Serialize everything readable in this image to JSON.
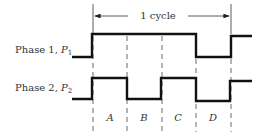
{
  "diagram": {
    "cycle_label": "1 cycle",
    "signals": [
      {
        "name": "Phase 1",
        "symbol": "P",
        "subscript": "1",
        "sequence": [
          "low",
          "high",
          "high",
          "high",
          "low",
          "high"
        ]
      },
      {
        "name": "Phase 2",
        "symbol": "P",
        "subscript": "2",
        "sequence": [
          "low",
          "high",
          "low",
          "high",
          "low",
          "high"
        ]
      }
    ],
    "intervals": [
      "A",
      "B",
      "C",
      "D"
    ],
    "colors": {
      "line": "#111111",
      "text": "#333333",
      "background": "#ffffff"
    }
  }
}
